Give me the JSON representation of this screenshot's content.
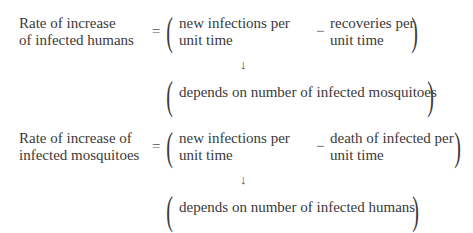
{
  "equations": [
    {
      "lhs": [
        "Rate of increase",
        "of infected humans"
      ],
      "equals": "=",
      "term1": [
        "new infections per",
        "unit time"
      ],
      "minus": "−",
      "term2": [
        "recoveries per",
        "unit time"
      ],
      "arrow": "↓",
      "note": "depends on number of infected mosquitoes"
    },
    {
      "lhs": [
        "Rate of increase of",
        "infected mosquitoes"
      ],
      "equals": "=",
      "term1": [
        "new infections per",
        "unit time"
      ],
      "minus": "−",
      "term2": [
        "death of infected per",
        "unit time"
      ],
      "arrow": "↓",
      "note": "depends on number of infected humans"
    }
  ],
  "glyphs": {
    "open_paren": "(",
    "close_paren": ")"
  }
}
